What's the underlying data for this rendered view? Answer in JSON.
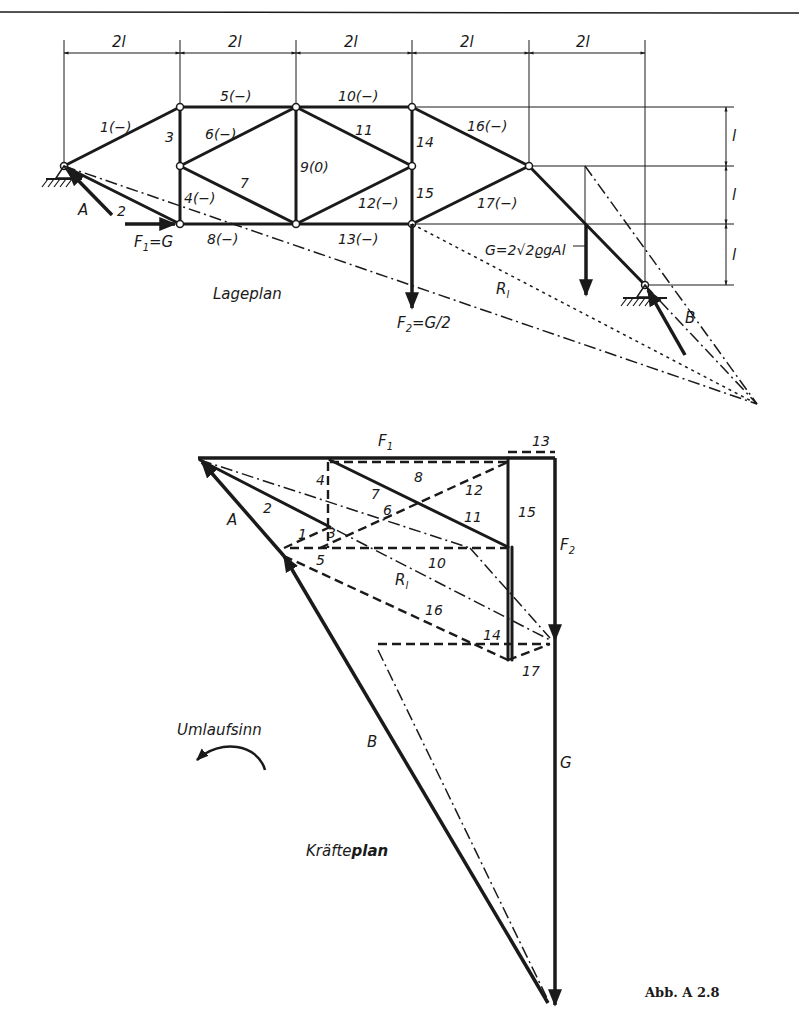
{
  "figure": {
    "caption": "Abb. A 2.8",
    "header_rule": true
  },
  "lageplan": {
    "title": "Lageplan",
    "dimensions": {
      "horizontal": [
        "2l",
        "2l",
        "2l",
        "2l",
        "2l"
      ],
      "vertical": [
        "l",
        "l",
        "l"
      ]
    },
    "members": {
      "m1": "1(−)",
      "m2": "2",
      "m3": "3",
      "m4": "4(−)",
      "m5": "5(−)",
      "m6": "6(−)",
      "m7": "7",
      "m8": "8(−)",
      "m9": "9(0)",
      "m10": "10(−)",
      "m11": "11",
      "m12": "12(−)",
      "m13": "13(−)",
      "m14": "14",
      "m15": "15",
      "m16": "16(−)",
      "m17": "17(−)"
    },
    "forces": {
      "A": "A",
      "B": "B",
      "F1": "F",
      "F1_sub": "1",
      "F1_eq": "=G",
      "F2": "F",
      "F2_sub": "2",
      "F2_eq": "=G/2",
      "G": "G=2√2ϱgAl",
      "Rl": "R",
      "Rl_sub": "l"
    }
  },
  "kraefteplan": {
    "title_normal": "Kräfte",
    "title_bold": "plan",
    "rotation_label": "Umlaufsinn",
    "labels": {
      "F1": "F",
      "F1_sub": "1",
      "F2": "F",
      "F2_sub": "2",
      "A": "A",
      "B": "B",
      "G": "G",
      "Rl": "R",
      "Rl_sub": "l",
      "n1": "1",
      "n2": "2",
      "n3": "3",
      "n4": "4",
      "n5": "5",
      "n6": "6",
      "n7": "7",
      "n8": "8",
      "n10": "10",
      "n11": "11",
      "n12": "12",
      "n13": "13",
      "n14": "14",
      "n15": "15",
      "n16": "16",
      "n17": "17"
    }
  }
}
